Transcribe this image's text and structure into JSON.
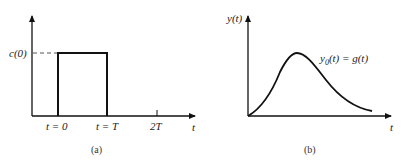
{
  "figure_a": {
    "caption": "(a)",
    "y_level_label": "c(0)",
    "x_ticks": [
      "t = 0",
      "t = T",
      "2T"
    ],
    "x_axis_label": "t",
    "shape": "rectangular pulse"
  },
  "figure_b": {
    "caption": "(b)",
    "y_axis_label": "y(t)",
    "x_axis_label": "t",
    "curve_label_main": "y",
    "curve_label_sub": "0",
    "curve_label_rest": "(t) = g(t)",
    "shape": "impulse response curve"
  },
  "colors": {
    "line": "#111111",
    "dash": "#555555"
  }
}
